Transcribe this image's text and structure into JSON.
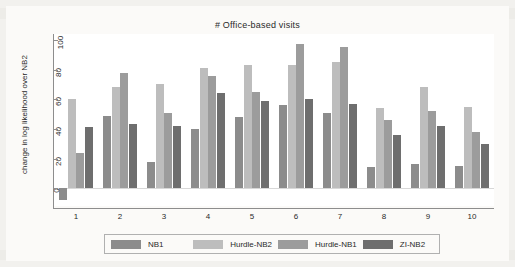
{
  "chart_data": {
    "type": "bar",
    "title": "# Office-based visits",
    "xlabel": "",
    "ylabel": "change in log likelihood over NB2",
    "categories": [
      "1",
      "2",
      "3",
      "4",
      "5",
      "6",
      "7",
      "8",
      "9",
      "10"
    ],
    "ylim": [
      -12,
      104
    ],
    "yticks": [
      0,
      20,
      40,
      60,
      80,
      100
    ],
    "grid": false,
    "legend_position": "bottom",
    "series": [
      {
        "name": "NB1",
        "color": "#8c8c8c",
        "values": [
          -8,
          49,
          18,
          40,
          48,
          56,
          51,
          14,
          16,
          15
        ]
      },
      {
        "name": "Hurdle-NB2",
        "color": "#bdbdbd",
        "values": [
          60,
          68,
          70,
          81,
          83,
          83,
          85,
          54,
          68,
          55
        ]
      },
      {
        "name": "Hurdle-NB1",
        "color": "#9c9c9c",
        "values": [
          24,
          78,
          51,
          76,
          65,
          97,
          95,
          46,
          52,
          38
        ]
      },
      {
        "name": "ZI-NB2",
        "color": "#6e6e6e",
        "values": [
          41,
          43,
          42,
          64,
          59,
          60,
          57,
          36,
          42,
          30
        ]
      }
    ]
  },
  "legend": {
    "items": [
      {
        "label": "NB1"
      },
      {
        "label": "Hurdle-NB2"
      },
      {
        "label": "Hurdle-NB1"
      },
      {
        "label": "ZI-NB2"
      }
    ]
  }
}
